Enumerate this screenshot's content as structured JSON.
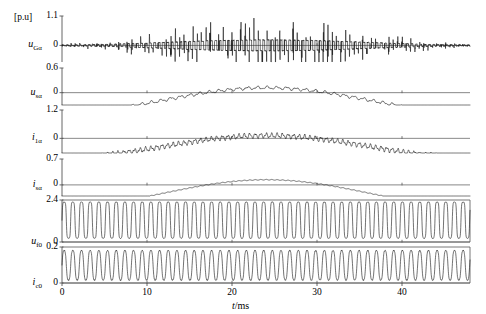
{
  "figure": {
    "unit_label": "[p.u]",
    "xaxis_title_var": "t",
    "xaxis_title_unit": "/ms",
    "x_ticks": [
      0,
      10,
      20,
      30,
      40
    ],
    "x_range": [
      0,
      48
    ],
    "background": "#ffffff",
    "trace_color": "#1a1a1a",
    "axis_color": "#555555"
  },
  "chart_data": {
    "type": "line",
    "title": "",
    "xlabel": "t/ms",
    "ylabel": "[p.u]",
    "grid": false,
    "legend": "none",
    "x": {
      "min": 0,
      "max": 48,
      "ticks": [
        0,
        10,
        20,
        30,
        40
      ],
      "unit": "ms"
    },
    "panels": [
      {
        "index": 0,
        "label_main": "u",
        "label_sub": "Gα",
        "label_plain": "u_Ga",
        "y_ticks": [
          1.1,
          0
        ],
        "ylim": [
          -0.62,
          1.1
        ],
        "baseline": 0,
        "waveform": "pwm-burst",
        "params": {
          "carrier_hz": 1.95,
          "env_base": 0.2,
          "env_amp": 0.17,
          "env_hz": 0.0208,
          "env_phase": -1.5708,
          "spike_prob": 0.42,
          "spike_gain": 2.3,
          "noise": 0.035
        },
        "description": "High-frequency switched voltage, bursts of spikes with amplitude envelope growing to a peak near 22 ms"
      },
      {
        "index": 1,
        "label_main": "u",
        "label_sub": "sα",
        "label_plain": "u_sa",
        "y_ticks": [
          0.6,
          0
        ],
        "ylim": [
          -0.3,
          0.6
        ],
        "baseline": 0,
        "waveform": "ripple-hump",
        "params": {
          "hump_amp": 0.3,
          "hump_hz": 0.0208,
          "hump_phase": -1.5708,
          "offset": -0.18,
          "ripple_amp": 0.03,
          "ripple_hz": 0.88,
          "noise": 0.01
        },
        "description": "Grid-side voltage alpha component: slow one-cycle hump peaking near 22 ms with switching ripple"
      },
      {
        "index": 2,
        "label_main": "i",
        "label_sub": "1α",
        "label_plain": "i_1a",
        "y_ticks": [
          1.2,
          0
        ],
        "ylim": [
          -0.62,
          1.2
        ],
        "baseline": 0,
        "waveform": "ripple-hump",
        "params": {
          "hump_amp": 0.46,
          "hump_hz": 0.0208,
          "hump_phase": -1.5708,
          "offset": -0.34,
          "ripple_amp": 0.085,
          "ripple_hz": 1.55,
          "noise": 0.03
        },
        "description": "Converter current alpha component: hump peaking near 23 ms with dense high-frequency ripple"
      },
      {
        "index": 3,
        "label_main": "i",
        "label_sub": "sα",
        "label_plain": "i_sa",
        "y_ticks": [
          0.7,
          0
        ],
        "ylim": [
          -0.3,
          0.7
        ],
        "baseline": 0,
        "waveform": "smooth-hump",
        "params": {
          "hump_amp": 0.36,
          "hump_hz": 0.0208,
          "hump_phase": -1.5708,
          "offset": -0.22,
          "ripple_amp": 0.009,
          "ripple_hz": 1.55,
          "noise": 0.003
        },
        "description": "Grid current alpha component: smooth half-sine hump peaking near 24 ms, nearly ripple free"
      },
      {
        "index": 4,
        "label_main": "u",
        "label_sub": "f0",
        "label_plain": "u_f0",
        "y_ticks": [
          2.4,
          0
        ],
        "ylim": [
          0,
          2.4
        ],
        "baseline": 0,
        "waveform": "rect-osc",
        "params": {
          "center": 1.25,
          "amp": 1.05,
          "hz": 0.98,
          "noise": 0.02,
          "flat": 0.55
        },
        "description": "Zero-sequence filter voltage: sustained high-frequency near-rectangular oscillation filling 0 to 2.4 p.u."
      },
      {
        "index": 5,
        "label_main": "i",
        "label_sub": "c0",
        "label_plain": "i_c0",
        "y_ticks": [
          0.2,
          0
        ],
        "ylim": [
          0,
          0.2
        ],
        "baseline": 0,
        "waveform": "sine-osc",
        "params": {
          "center": 0.098,
          "amp": 0.092,
          "hz": 0.98,
          "noise": 0.004
        },
        "description": "Zero-sequence capacitor current: continuous oscillation between 0 and 0.2 p.u."
      }
    ]
  }
}
